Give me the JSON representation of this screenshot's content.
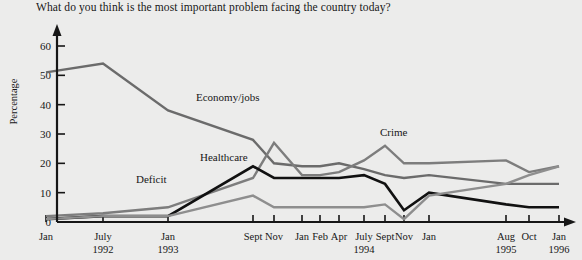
{
  "chart_data": {
    "type": "line",
    "title": "What do you think is the most important problem facing the country today?",
    "xlabel": "",
    "ylabel": "Percentage",
    "ylim": [
      0,
      60
    ],
    "yticks": [
      0,
      10,
      20,
      30,
      40,
      50,
      60
    ],
    "grid": false,
    "legend_position": "inline-labels",
    "x_tick_labels": [
      {
        "label": "Jan",
        "year": "",
        "x": 46
      },
      {
        "label": "July",
        "year": "1992",
        "x": 103
      },
      {
        "label": "Jan",
        "year": "1993",
        "x": 168
      },
      {
        "label": "Sept",
        "year": "",
        "x": 253
      },
      {
        "label": "Nov",
        "year": "",
        "x": 274
      },
      {
        "label": "Jan",
        "year": "",
        "x": 302
      },
      {
        "label": "Feb",
        "year": "",
        "x": 320
      },
      {
        "label": "Apr",
        "year": "",
        "x": 339
      },
      {
        "label": "July",
        "year": "1994",
        "x": 364
      },
      {
        "label": "Sept",
        "year": "",
        "x": 385
      },
      {
        "label": "Nov",
        "year": "",
        "x": 404
      },
      {
        "label": "Jan",
        "year": "",
        "x": 429
      },
      {
        "label": "Aug",
        "year": "1995",
        "x": 506
      },
      {
        "label": "Oct",
        "year": "",
        "x": 529
      },
      {
        "label": "Jan",
        "year": "1996",
        "x": 559
      }
    ],
    "series": [
      {
        "name": "Economy/jobs",
        "color": "#6b6b6b",
        "label_x": 196,
        "label_y": 101,
        "points": [
          {
            "x": 46,
            "y": 51
          },
          {
            "x": 103,
            "y": 54
          },
          {
            "x": 168,
            "y": 38
          },
          {
            "x": 253,
            "y": 28
          },
          {
            "x": 274,
            "y": 20
          },
          {
            "x": 302,
            "y": 19
          },
          {
            "x": 320,
            "y": 19
          },
          {
            "x": 339,
            "y": 20
          },
          {
            "x": 364,
            "y": 18
          },
          {
            "x": 385,
            "y": 16
          },
          {
            "x": 404,
            "y": 15
          },
          {
            "x": 429,
            "y": 16
          },
          {
            "x": 506,
            "y": 13
          },
          {
            "x": 529,
            "y": 13
          },
          {
            "x": 559,
            "y": 13
          }
        ]
      },
      {
        "name": "Crime",
        "color": "#7d7d7d",
        "label_x": 380,
        "label_y": 136,
        "points": [
          {
            "x": 46,
            "y": 2
          },
          {
            "x": 103,
            "y": 3
          },
          {
            "x": 168,
            "y": 5
          },
          {
            "x": 253,
            "y": 15
          },
          {
            "x": 274,
            "y": 27
          },
          {
            "x": 302,
            "y": 16
          },
          {
            "x": 320,
            "y": 16
          },
          {
            "x": 339,
            "y": 17
          },
          {
            "x": 364,
            "y": 21
          },
          {
            "x": 385,
            "y": 26
          },
          {
            "x": 404,
            "y": 20
          },
          {
            "x": 429,
            "y": 20
          },
          {
            "x": 506,
            "y": 21
          },
          {
            "x": 529,
            "y": 17
          },
          {
            "x": 559,
            "y": 19
          }
        ]
      },
      {
        "name": "Healthcare",
        "color": "#111111",
        "label_x": 200,
        "label_y": 161,
        "points": [
          {
            "x": 46,
            "y": 1
          },
          {
            "x": 103,
            "y": 2
          },
          {
            "x": 168,
            "y": 2
          },
          {
            "x": 253,
            "y": 19
          },
          {
            "x": 274,
            "y": 15
          },
          {
            "x": 302,
            "y": 15
          },
          {
            "x": 320,
            "y": 15
          },
          {
            "x": 339,
            "y": 15
          },
          {
            "x": 364,
            "y": 16
          },
          {
            "x": 385,
            "y": 13
          },
          {
            "x": 404,
            "y": 4
          },
          {
            "x": 429,
            "y": 10
          },
          {
            "x": 506,
            "y": 6
          },
          {
            "x": 529,
            "y": 5
          },
          {
            "x": 559,
            "y": 5
          }
        ]
      },
      {
        "name": "Deficit",
        "color": "#8e8e8e",
        "label_x": 136,
        "label_y": 183,
        "points": [
          {
            "x": 46,
            "y": 1
          },
          {
            "x": 103,
            "y": 2
          },
          {
            "x": 168,
            "y": 2
          },
          {
            "x": 253,
            "y": 9
          },
          {
            "x": 274,
            "y": 5
          },
          {
            "x": 302,
            "y": 5
          },
          {
            "x": 320,
            "y": 5
          },
          {
            "x": 339,
            "y": 5
          },
          {
            "x": 364,
            "y": 5
          },
          {
            "x": 385,
            "y": 6
          },
          {
            "x": 404,
            "y": 1
          },
          {
            "x": 429,
            "y": 9
          },
          {
            "x": 506,
            "y": 13
          },
          {
            "x": 529,
            "y": 16
          },
          {
            "x": 559,
            "y": 19
          }
        ]
      }
    ]
  }
}
